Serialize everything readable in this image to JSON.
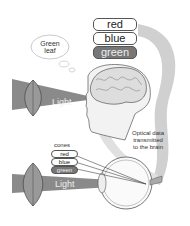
{
  "thought_bubble": {
    "text_line1": "Green",
    "text_line2": "leaf"
  },
  "brain_color_labels": [
    {
      "label": "red",
      "active": false
    },
    {
      "label": "blue",
      "active": false
    },
    {
      "label": "green",
      "active": true
    }
  ],
  "top_light_label": "Light",
  "bottom_light_label": "Light",
  "cones": {
    "title": "cones",
    "items": [
      {
        "label": "red",
        "active": false
      },
      {
        "label": "blue",
        "active": false
      },
      {
        "label": "green",
        "active": true
      }
    ]
  },
  "transmission_caption": {
    "line1": "Optical data",
    "line2": "transmitted",
    "line3": "to the brain"
  },
  "colors": {
    "beam": "#8a8a8a",
    "arrow": "#c8c8c8",
    "outline": "#555555",
    "active_pill": "#777777"
  }
}
